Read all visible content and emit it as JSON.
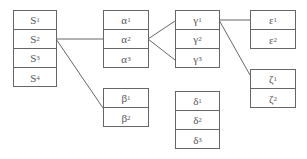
{
  "tables": {
    "S": {
      "base": "S",
      "subs": [
        "1",
        "2",
        "3",
        "4"
      ]
    },
    "alpha": {
      "base": "α",
      "subs": [
        "1",
        "2",
        "3"
      ]
    },
    "beta": {
      "base": "β",
      "subs": [
        "1",
        "2"
      ]
    },
    "gamma": {
      "base": "γ",
      "subs": [
        "1",
        "2",
        "3"
      ]
    },
    "delta": {
      "base": "δ",
      "subs": [
        "1",
        "2",
        "3"
      ]
    },
    "epsilon": {
      "base": "ε",
      "subs": [
        "1",
        "2"
      ]
    },
    "zeta": {
      "base": "ζ",
      "subs": [
        "1",
        "2"
      ]
    }
  },
  "links": [
    {
      "from": "S2",
      "to": "alpha"
    },
    {
      "from": "S2",
      "to": "beta"
    },
    {
      "from": "alpha2",
      "to": "gamma1"
    },
    {
      "from": "alpha2",
      "to": "gamma3"
    },
    {
      "from": "gamma1",
      "to": "epsilon1"
    },
    {
      "from": "gamma1",
      "to": "zeta"
    }
  ],
  "line_color": "#666666"
}
